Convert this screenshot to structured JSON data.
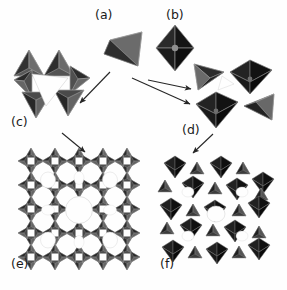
{
  "figure": {
    "width": 287,
    "height": 290,
    "background_color": "#fefefe",
    "caption_style": "lowercase-letter-in-parentheses"
  },
  "colors": {
    "tetra_face_light": "#6e6e6e",
    "tetra_face_mid": "#4a4a4a",
    "tetra_face_dark": "#2b2b2b",
    "tetra_edge": "#9a9a9a",
    "octa_face_light": "#323232",
    "octa_face_mid": "#1e1e1e",
    "octa_face_dark": "#0d0d0d",
    "octa_edge": "#777777",
    "arrow_color": "#262626",
    "label_color": "#1a1a1a",
    "void_color": "#fefefe"
  },
  "panels": [
    {
      "id": "a",
      "label": "(a)",
      "name": "tetrahedron-unit",
      "kind": "single-tetrahedron",
      "description": "single TO4 tetrahedron building unit",
      "polyhedra_count": 1,
      "label_x": 95,
      "label_y": 9
    },
    {
      "id": "b",
      "label": "(b)",
      "name": "octahedron-unit",
      "kind": "single-octahedron",
      "description": "single MO6 octahedron building unit",
      "polyhedra_count": 1,
      "label_x": 166,
      "label_y": 9
    },
    {
      "id": "c",
      "label": "(c)",
      "name": "tetrahedral-ring-cluster",
      "kind": "tetrahedra-ring",
      "description": "ring of corner-sharing tetrahedra enclosing a triangular void",
      "polyhedra_count": 6,
      "label_x": 11,
      "label_y": 116
    },
    {
      "id": "d",
      "label": "(d)",
      "name": "mixed-polyhedra-cluster",
      "kind": "mixed-tetrahedra-octahedra",
      "description": "cluster of two tetrahedra and two octahedra sharing corners",
      "polyhedra_count": 4,
      "label_x": 182,
      "label_y": 124
    },
    {
      "id": "e",
      "label": "(e)",
      "name": "tetrahedral-framework",
      "kind": "extended-tetrahedral-framework",
      "description": "extended porous framework built entirely from tetrahedra with large circular channels",
      "polyhedra_count": 120,
      "label_x": 11,
      "label_y": 258
    },
    {
      "id": "f",
      "label": "(f)",
      "name": "mixed-framework",
      "kind": "extended-mixed-framework",
      "description": "extended framework built from octahedra and tetrahedra",
      "polyhedra_count": 40,
      "label_x": 160,
      "label_y": 258
    }
  ],
  "arrows": [
    {
      "name": "arrow-a-to-c",
      "from": "a",
      "to": "c",
      "x1": 110,
      "y1": 72,
      "x2": 80,
      "y2": 103
    },
    {
      "name": "arrow-b-to-d",
      "from": "b",
      "to": "d",
      "x1": 148,
      "y1": 80,
      "x2": 191,
      "y2": 89
    },
    {
      "name": "arrow-a-to-d",
      "from": "a",
      "to": "d",
      "x1": 132,
      "y1": 78,
      "x2": 190,
      "y2": 104
    },
    {
      "name": "arrow-c-to-e",
      "from": "c",
      "to": "e",
      "x1": 62,
      "y1": 133,
      "x2": 85,
      "y2": 152
    },
    {
      "name": "arrow-d-to-f",
      "from": "d",
      "to": "f",
      "x1": 213,
      "y1": 134,
      "x2": 193,
      "y2": 153
    }
  ]
}
